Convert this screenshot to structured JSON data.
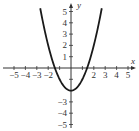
{
  "chart_data": {
    "type": "line",
    "title": "",
    "xlabel": "x",
    "ylabel": "y",
    "xlim": [
      -5,
      5
    ],
    "ylim": [
      -5,
      5
    ],
    "grid": false,
    "x_ticks": [
      -5,
      -4,
      -3,
      -2,
      -1,
      0,
      1,
      2,
      3,
      4,
      5
    ],
    "y_ticks": [
      -5,
      -4,
      -3,
      -2,
      -1,
      0,
      1,
      2,
      3,
      4,
      5
    ],
    "x_tick_labels": [
      "-5",
      "-4",
      "-3",
      "-2",
      "2",
      "3",
      "4",
      "5"
    ],
    "y_tick_labels": [
      "5",
      "4",
      "3",
      "2",
      "1",
      "-3",
      "-4",
      "-5"
    ],
    "series": [
      {
        "name": "y = x^2 - 2",
        "equation": "y = x^2 - 2",
        "x_range": [
          -2.7,
          2.7
        ],
        "vertex": [
          0,
          -2
        ],
        "x_intercepts": [
          -1.414,
          1.414
        ],
        "points": [
          [
            -2.7,
            5.29
          ],
          [
            -2,
            2
          ],
          [
            -1.414,
            0
          ],
          [
            -1,
            -1
          ],
          [
            0,
            -2
          ],
          [
            1,
            -1
          ],
          [
            1.414,
            0
          ],
          [
            2,
            2
          ],
          [
            2.7,
            5.29
          ]
        ],
        "color": "#1a1a1a"
      }
    ]
  },
  "style": {
    "axis_color": "#333333",
    "curve_color": "#1a1a1a"
  }
}
